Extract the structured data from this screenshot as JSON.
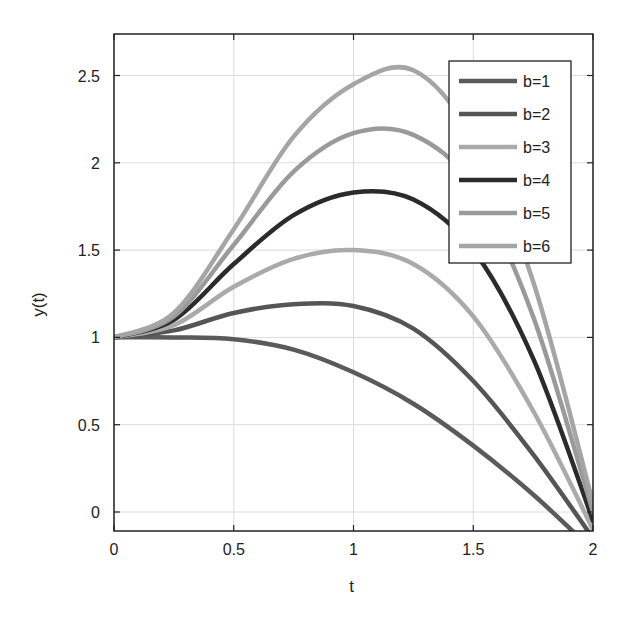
{
  "chart_data": {
    "type": "line",
    "title": "",
    "xlabel": "t",
    "ylabel": "y(t)",
    "xlim": [
      0,
      2
    ],
    "ylim": [
      -0.1,
      2.75
    ],
    "xticks": [
      "0",
      "0.5",
      "1",
      "1.5",
      "2"
    ],
    "xtick_values": [
      0,
      0.5,
      1,
      1.5,
      2
    ],
    "yticks": [
      "0",
      "0.5",
      "1",
      "1.5",
      "2",
      "2.5"
    ],
    "ytick_values": [
      0,
      0.5,
      1,
      1.5,
      2,
      2.5
    ],
    "grid": true,
    "legend_position": "upper right",
    "x": [
      0,
      0.25,
      0.5,
      0.75,
      1.0,
      1.25,
      1.5,
      1.75,
      2.0
    ],
    "series": [
      {
        "name": "b=1",
        "color": "#5a5a5a",
        "values": [
          1.0,
          1.0,
          0.99,
          0.93,
          0.8,
          0.62,
          0.38,
          0.1,
          -0.22
        ]
      },
      {
        "name": "b=2",
        "color": "#555555",
        "values": [
          1.0,
          1.04,
          1.14,
          1.19,
          1.18,
          1.05,
          0.75,
          0.33,
          -0.15
        ]
      },
      {
        "name": "b=3",
        "color": "#aaaaaa",
        "values": [
          1.0,
          1.07,
          1.29,
          1.45,
          1.5,
          1.42,
          1.12,
          0.58,
          -0.1
        ]
      },
      {
        "name": "b=4",
        "color": "#2b2b2b",
        "values": [
          1.0,
          1.1,
          1.42,
          1.7,
          1.83,
          1.79,
          1.5,
          0.88,
          -0.05
        ]
      },
      {
        "name": "b=5",
        "color": "#9a9a9a",
        "values": [
          1.0,
          1.12,
          1.53,
          1.95,
          2.17,
          2.16,
          1.86,
          1.12,
          0.0
        ]
      },
      {
        "name": "b=6",
        "color": "#a5a5a5",
        "values": [
          1.0,
          1.14,
          1.62,
          2.15,
          2.45,
          2.53,
          2.14,
          1.32,
          0.05
        ]
      }
    ]
  }
}
